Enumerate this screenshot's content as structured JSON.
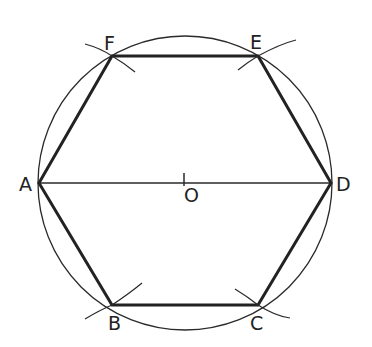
{
  "diagram": {
    "type": "geometric-construction",
    "colors": {
      "stroke": "#2a2a2a",
      "background": "#ffffff"
    },
    "center": {
      "label": "O",
      "x": 185,
      "y": 183
    },
    "radius": 147,
    "vertices": [
      {
        "label": "A",
        "x": 39,
        "y": 183
      },
      {
        "label": "B",
        "x": 112,
        "y": 305
      },
      {
        "label": "C",
        "x": 258,
        "y": 305
      },
      {
        "label": "D",
        "x": 331,
        "y": 183
      },
      {
        "label": "E",
        "x": 258,
        "y": 56
      },
      {
        "label": "F",
        "x": 112,
        "y": 56
      }
    ],
    "diameter": {
      "from": "A",
      "to": "D"
    },
    "arc_marks": [
      "B",
      "C",
      "E",
      "F"
    ]
  }
}
